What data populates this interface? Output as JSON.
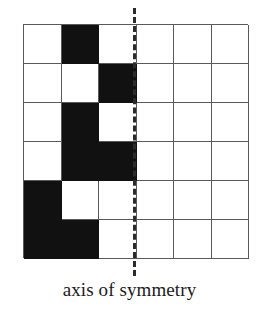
{
  "figure": {
    "caption": "axis of symmetry",
    "grid": {
      "rows": 6,
      "columns": 6,
      "cell_width_px": 37.5,
      "cell_height_px": 39,
      "line_color": "#5a5a5a",
      "filled_color": "#111111",
      "empty_color": "#ffffff",
      "legend": {
        "filled": "shaded square",
        "empty": "blank square"
      },
      "cells": [
        [
          "empty",
          "filled",
          "empty",
          "empty",
          "empty",
          "empty"
        ],
        [
          "empty",
          "empty",
          "filled",
          "empty",
          "empty",
          "empty"
        ],
        [
          "empty",
          "filled",
          "empty",
          "empty",
          "empty",
          "empty"
        ],
        [
          "empty",
          "filled",
          "filled",
          "empty",
          "empty",
          "empty"
        ],
        [
          "filled",
          "empty",
          "empty",
          "empty",
          "empty",
          "empty"
        ],
        [
          "filled",
          "filled",
          "empty",
          "empty",
          "empty",
          "empty"
        ]
      ]
    },
    "axis": {
      "label": "axis of symmetry",
      "orientation": "vertical",
      "style": "dashed",
      "color": "#2b2b2b",
      "position_after_column": 3
    }
  }
}
